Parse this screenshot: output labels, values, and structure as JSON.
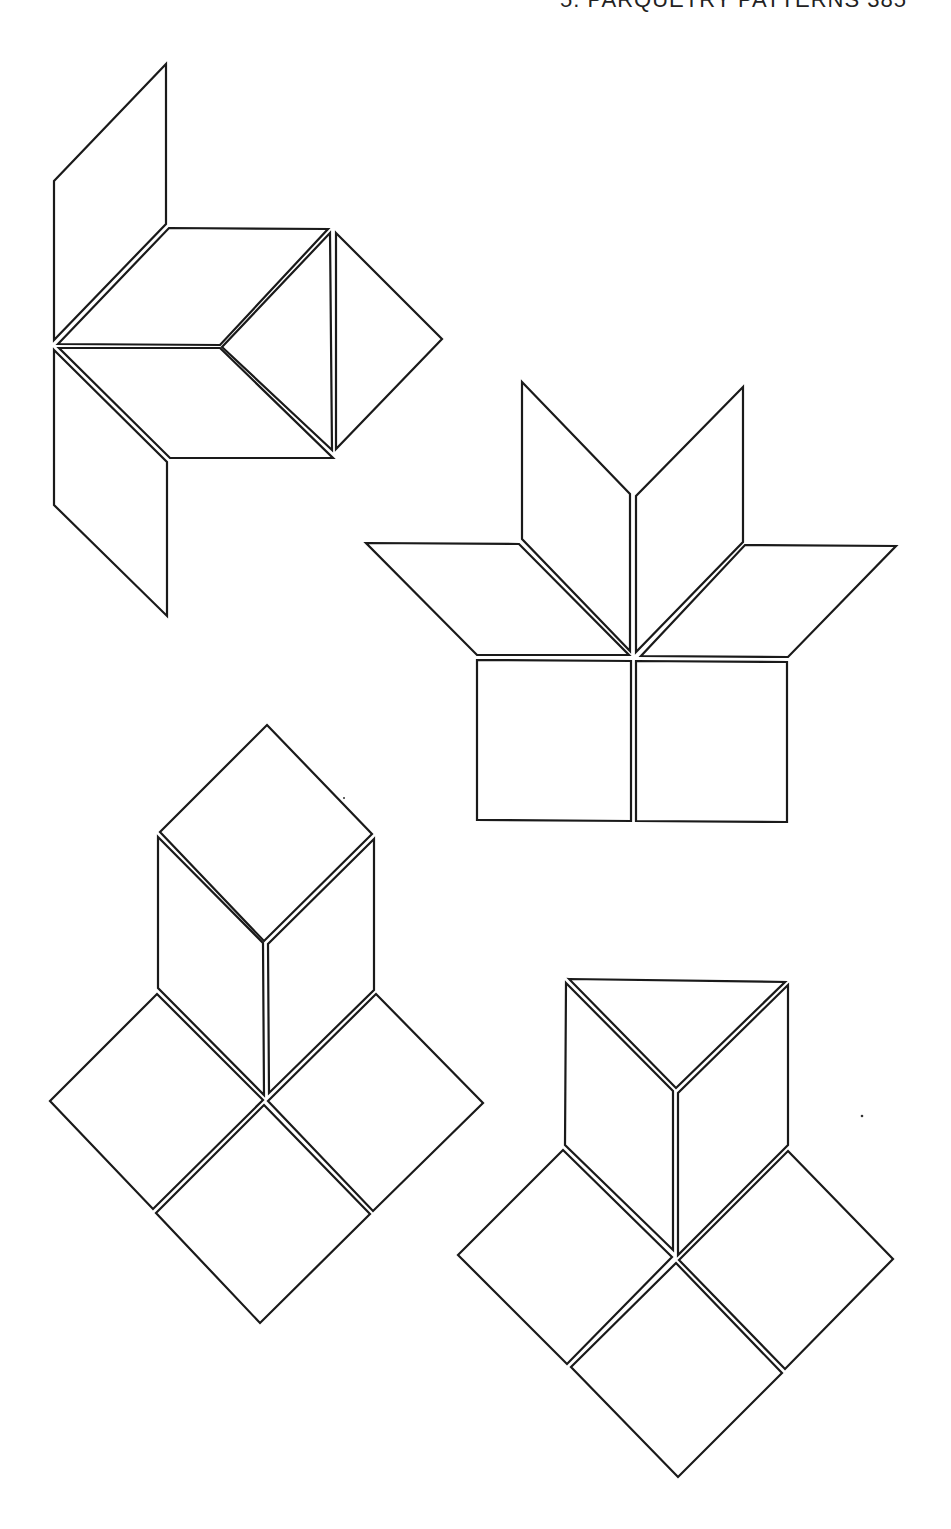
{
  "page": {
    "running_head": "5. PARQUETRY PATTERNS 385",
    "stroke_color": "#1a1a1a",
    "background": "#ffffff"
  },
  "figures": [
    {
      "name": "figure-1-rhombus-triangle-cluster",
      "pieces": [
        {
          "shape": "rhombus",
          "points": "54,181 166,64 166,224 54,340"
        },
        {
          "shape": "rhombus",
          "points": "58,344 169,228 328,229 220,345"
        },
        {
          "shape": "rhombus",
          "points": "59,348 220,348 333,458 170,458"
        },
        {
          "shape": "triangle",
          "points": "222,347 330,233 332,450"
        },
        {
          "shape": "triangle",
          "points": "336,233 442,339 336,449"
        },
        {
          "shape": "rhombus",
          "points": "54,350 167,462 167,616 54,505"
        }
      ]
    },
    {
      "name": "figure-2-flower-on-squares",
      "pieces": [
        {
          "shape": "rhombus",
          "points": "522,382 630,494 630,651 522,539"
        },
        {
          "shape": "rhombus",
          "points": "743,387 636,496 636,652 743,542"
        },
        {
          "shape": "rhombus",
          "points": "366,543 519,544 629,655 477,655"
        },
        {
          "shape": "rhombus",
          "points": "745,545 896,546 788,657 641,656"
        },
        {
          "shape": "square",
          "points": "477,660 631,661 631,821 477,820"
        },
        {
          "shape": "square",
          "points": "636,661 787,662 787,822 636,821"
        }
      ]
    },
    {
      "name": "figure-3-cube-on-squares",
      "pieces": [
        {
          "shape": "square",
          "points": "267,725 372,834 264,941 160,832"
        },
        {
          "shape": "rhombus",
          "points": "158,837 263,943 264,1095 158,988"
        },
        {
          "shape": "rhombus",
          "points": "374,839 268,944 269,1093 374,990"
        },
        {
          "shape": "square",
          "points": "157,994 263,1100 153,1209 50,1101"
        },
        {
          "shape": "square",
          "points": "376,994 483,1103 373,1211 268,1101"
        },
        {
          "shape": "square",
          "points": "264,1105 370,1214 260,1323 156,1213"
        }
      ]
    },
    {
      "name": "figure-4-triangle-cube-on-squares",
      "pieces": [
        {
          "shape": "triangle",
          "points": "569,979 785,982 676,1088"
        },
        {
          "shape": "rhombus",
          "points": "566,983 673,1091 673,1250 565,1145"
        },
        {
          "shape": "rhombus",
          "points": "788,985 678,1093 678,1255 788,1145"
        },
        {
          "shape": "square",
          "points": "563,1150 672,1257 567,1364 458,1255"
        },
        {
          "shape": "square",
          "points": "788,1151 893,1259 785,1369 679,1260"
        },
        {
          "shape": "square",
          "points": "676,1263 782,1373 678,1477 571,1367"
        }
      ]
    }
  ]
}
